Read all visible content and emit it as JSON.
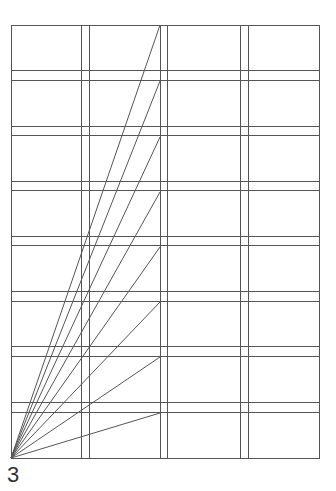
{
  "figure": {
    "label": "3",
    "line_color": "#555555",
    "frame": {
      "x0": 11,
      "y0": 25,
      "x1": 319,
      "y1": 458
    },
    "vertical_lines": [
      81,
      89,
      160,
      167,
      240,
      248
    ],
    "horizontal_lines": [
      70,
      80,
      126,
      135,
      181,
      190,
      236,
      245,
      291,
      301,
      346,
      356,
      402,
      412
    ],
    "fan": {
      "origin": [
        11,
        458
      ],
      "end_x": 160,
      "end_y": [
        25,
        81,
        137,
        192,
        247,
        302,
        357,
        413
      ]
    }
  }
}
